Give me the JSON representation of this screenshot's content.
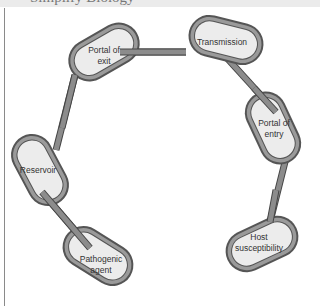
{
  "header": {
    "title_cropped": "Simplify Biology"
  },
  "diagram": {
    "type": "chain-of-infection",
    "colors": {
      "link_outer": "#555555",
      "link_band": "#9a9a9a",
      "link_fill": "#ececec",
      "bar": "#8c8c8c"
    },
    "links": [
      {
        "id": "portal-of-exit",
        "line1": "Portal of",
        "line2": "exit"
      },
      {
        "id": "transmission",
        "line1": "Transmission",
        "line2": ""
      },
      {
        "id": "portal-of-entry",
        "line1": "Portal of",
        "line2": "entry"
      },
      {
        "id": "host-susceptibility",
        "line1": "Host",
        "line2": "susceptibility"
      },
      {
        "id": "reservoir",
        "line1": "Reservoir",
        "line2": ""
      },
      {
        "id": "pathogenic-agent",
        "line1": "Pathogenic",
        "line2": "agent"
      }
    ]
  }
}
